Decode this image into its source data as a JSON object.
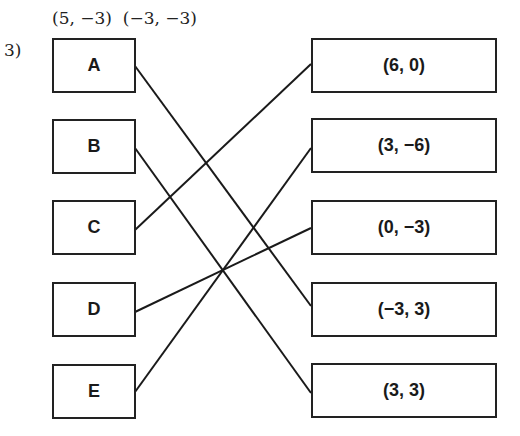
{
  "header": {
    "hint_left": "(5, −3)",
    "hint_right": "(−3, −3)",
    "problem_number": "3)"
  },
  "left_items": [
    {
      "label": "A"
    },
    {
      "label": "B"
    },
    {
      "label": "C"
    },
    {
      "label": "D"
    },
    {
      "label": "E"
    }
  ],
  "right_items": [
    {
      "label": "(6, 0)"
    },
    {
      "label": "(3, −6)"
    },
    {
      "label": "(0, −3)"
    },
    {
      "label": "(−3, 3)"
    },
    {
      "label": "(3, 3)"
    }
  ],
  "matches": [
    {
      "from": "A",
      "to": "(−3, 3)"
    },
    {
      "from": "B",
      "to": "(3, 3)"
    },
    {
      "from": "C",
      "to": "(6, 0)"
    },
    {
      "from": "D",
      "to": "(0, −3)"
    },
    {
      "from": "E",
      "to": "(3, −6)"
    }
  ]
}
